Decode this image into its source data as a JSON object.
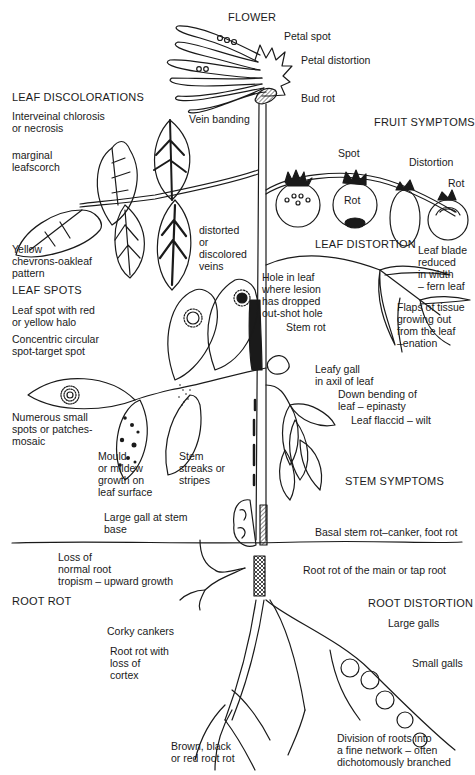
{
  "diagram": {
    "type": "plant-disease-symptoms",
    "sections": {
      "flower": "FLOWER",
      "leaf_discolorations": "LEAF DISCOLORATIONS",
      "fruit_symptoms": "FRUIT SYMPTOMS",
      "leaf_spots": "LEAF SPOTS",
      "leaf_distortion": "LEAF DISTORTION",
      "stem_symptoms": "STEM SYMPTOMS",
      "root_rot": "ROOT ROT",
      "root_distortion": "ROOT DISTORTION"
    },
    "labels": {
      "petal_spot": "Petal spot",
      "petal_distortion": "Petal distortion",
      "bud_rot": "Bud rot",
      "interveinal": "Interveinal chlorosis\nor necrosis",
      "vein_banding": "Vein banding",
      "marginal": "marginal\nleafscorch",
      "distorted_veins": "distorted\nor\ndiscolored\nveins",
      "yellow_chevrons": "Yellow\nchevrons-oakleaf\npattern",
      "fruit_spot": "Spot",
      "fruit_rot_1": "Rot",
      "fruit_distortion": "Distortion",
      "fruit_rot_2": "Rot",
      "leaf_blade_reduced": "Leaf blade\nreduced\nin width\n– fern leaf",
      "leaf_spot_halo": "Leaf spot with red\nor yellow halo",
      "concentric": "Concentric circular\nspot-target spot",
      "shot_hole": "Hole in leaf\nwhere lesion\nhas dropped\nout-shot hole",
      "stem_rot": "Stem rot",
      "enation": "Flaps of tissue\ngrowing out\nfrom the leaf\n–enation",
      "leafy_gall": "Leafy gall\nin axil of leaf",
      "epinasty": "Down bending of\nleaf – epinasty",
      "wilt": "Leaf flaccid – wilt",
      "mosaic": "Numerous small\nspots or patches-\nmosaic",
      "mould": "Mould\nor mildew\ngrowth on\nleaf surface",
      "stem_streaks": "Stem\nstreaks or\nstripes",
      "large_gall_stem": "Large gall at stem\nbase",
      "basal_stem_rot": "Basal stem rot–canker, foot rot",
      "loss_tropism": "Loss of\nnormal root\ntropism – upward growth",
      "tap_root_rot": "Root rot of the main or tap root",
      "corky_cankers": "Corky cankers",
      "large_galls": "Large galls",
      "root_rot_cortex": "Root rot with\nloss of\ncortex",
      "small_galls": "Small galls",
      "brown_root_rot": "Brown, black\nor red root rot",
      "fine_network": "Division of roots into\na fine network – often\ndichotomously branched"
    },
    "colors": {
      "ink": "#1a1a1a",
      "paper": "#ffffff"
    }
  }
}
